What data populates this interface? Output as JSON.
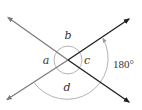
{
  "diagram": {
    "width": 142,
    "height": 110,
    "center": {
      "x": 68,
      "y": 60
    },
    "colors": {
      "background": "#ffffff",
      "line_light": "#7a7a7a",
      "line_dark": "#1e1e1e",
      "arc": "#b4b4b4",
      "text": "#333333"
    },
    "lines": [
      {
        "id": "line-1",
        "from": {
          "x": 8,
          "y": 17
        },
        "to": {
          "x": 129,
          "y": 102
        },
        "description": "upper-left to lower-right"
      },
      {
        "id": "line-2",
        "from": {
          "x": 7,
          "y": 99
        },
        "to": {
          "x": 129,
          "y": 19
        },
        "description": "lower-left to upper-right"
      }
    ],
    "small_circle_radius": 14,
    "large_arc": {
      "radius": 41,
      "start": {
        "x": 34,
        "y": 82
      },
      "end": {
        "x": 103,
        "y": 38
      }
    },
    "labels": {
      "a": "a",
      "b": "b",
      "c": "c",
      "d": "d",
      "arc_measure": "180°"
    }
  }
}
